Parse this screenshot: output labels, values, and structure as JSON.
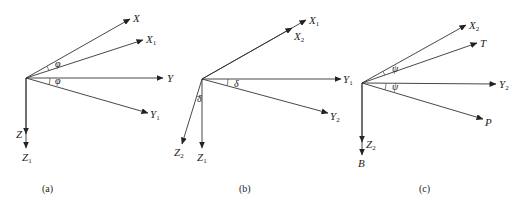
{
  "figure": {
    "panels": [
      {
        "id": "a",
        "caption": "(a)",
        "origin": [
          26,
          78
        ],
        "axes": [
          {
            "name": "X",
            "base": "X",
            "sub": "",
            "tip": [
              130,
              19
            ],
            "label_pos": [
              133,
              22
            ]
          },
          {
            "name": "X1",
            "base": "X",
            "sub": "1",
            "tip": [
              143,
              40
            ],
            "label_pos": [
              146,
              43
            ]
          },
          {
            "name": "Y",
            "base": "Y",
            "sub": "",
            "tip": [
              163,
              78
            ],
            "label_pos": [
              167,
              82
            ]
          },
          {
            "name": "Y1",
            "base": "Y",
            "sub": "1",
            "tip": [
              148,
              113
            ],
            "label_pos": [
              150,
              118
            ]
          },
          {
            "name": "Z",
            "base": "Z",
            "sub": "",
            "tip": [
              26,
              134
            ],
            "label_pos": [
              16,
              138
            ]
          },
          {
            "name": "Z1",
            "base": "Z",
            "sub": "1",
            "tip": [
              26,
              148
            ],
            "label_pos": [
              22,
              161
            ]
          }
        ],
        "angles": [
          {
            "symbol": "φ",
            "label_pos": [
              55,
              67
            ]
          },
          {
            "symbol": "φ",
            "label_pos": [
              55,
              84
            ]
          }
        ]
      },
      {
        "id": "b",
        "caption": "(b)",
        "origin": [
          202,
          79
        ],
        "axes": [
          {
            "name": "X1",
            "base": "X",
            "sub": "1",
            "tip": [
              306,
              20
            ],
            "label_pos": [
              309,
              24
            ]
          },
          {
            "name": "X2",
            "base": "X",
            "sub": "2",
            "tip": [
              292,
              28
            ],
            "label_pos": [
              294,
              40
            ]
          },
          {
            "name": "Y1",
            "base": "Y",
            "sub": "1",
            "tip": [
              341,
              79
            ],
            "label_pos": [
              343,
              83
            ]
          },
          {
            "name": "Y2",
            "base": "Y",
            "sub": "2",
            "tip": [
              328,
              113
            ],
            "label_pos": [
              330,
              120
            ]
          },
          {
            "name": "Z1",
            "base": "Z",
            "sub": "1",
            "tip": [
              202,
              148
            ],
            "label_pos": [
              197,
              161
            ]
          },
          {
            "name": "Z2",
            "base": "Z",
            "sub": "2",
            "tip": [
              182,
              144
            ],
            "label_pos": [
              174,
              156
            ]
          }
        ],
        "angles": [
          {
            "symbol": "δ",
            "label_pos": [
              234,
              87
            ]
          },
          {
            "symbol": "δ",
            "label_pos": [
              197,
              102
            ]
          }
        ]
      },
      {
        "id": "c",
        "caption": "(c)",
        "origin": [
          362,
          83
        ],
        "axes": [
          {
            "name": "X2",
            "base": "X",
            "sub": "2",
            "tip": [
              466,
              25
            ],
            "label_pos": [
              469,
              29
            ]
          },
          {
            "name": "T",
            "base": "T",
            "sub": "",
            "tip": [
              477,
              43
            ],
            "label_pos": [
              480,
              47
            ]
          },
          {
            "name": "Y2",
            "base": "Y",
            "sub": "2",
            "tip": [
              496,
              84
            ],
            "label_pos": [
              499,
              88
            ]
          },
          {
            "name": "P",
            "base": "P",
            "sub": "",
            "tip": [
              483,
              119
            ],
            "label_pos": [
              485,
              126
            ]
          },
          {
            "name": "Z2",
            "base": "Z",
            "sub": "2",
            "tip": [
              362,
              142
            ],
            "label_pos": [
              366,
              148
            ]
          },
          {
            "name": "B",
            "base": "B",
            "sub": "",
            "tip": [
              362,
              155
            ],
            "label_pos": [
              358,
              167
            ]
          }
        ],
        "angles": [
          {
            "symbol": "ψ",
            "label_pos": [
              392,
              72
            ]
          },
          {
            "symbol": "ψ",
            "label_pos": [
              392,
              90
            ]
          }
        ]
      }
    ],
    "caption_positions": {
      "a": [
        42,
        192
      ],
      "b": [
        239,
        192
      ],
      "c": [
        419,
        192
      ]
    }
  }
}
